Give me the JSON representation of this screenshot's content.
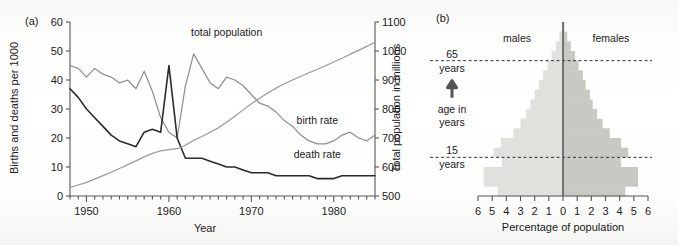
{
  "figure": {
    "panel_a_label": "(a)",
    "panel_b_label": "(b)"
  },
  "chart_data": [
    {
      "type": "line",
      "panel": "(a)",
      "title": "",
      "xlabel": "Year",
      "ylabel": "Births and deaths per 1000",
      "y2label": "Total population in millions",
      "xlim": [
        1948,
        1985
      ],
      "ylim": [
        0,
        60
      ],
      "y2lim": [
        500,
        1100
      ],
      "xticks": [
        1950,
        1960,
        1970,
        1980
      ],
      "xtick_labels": [
        "1950",
        "1960",
        "1970",
        "1980"
      ],
      "yticks": [
        0,
        10,
        20,
        30,
        40,
        50,
        60
      ],
      "ytick_labels": [
        "0",
        "10",
        "20",
        "30",
        "40",
        "50",
        "60"
      ],
      "y2ticks": [
        500,
        600,
        700,
        800,
        900,
        1000,
        1100
      ],
      "y2tick_labels": [
        "500",
        "600",
        "700",
        "800",
        "900",
        "1000",
        "1100"
      ],
      "minor_xtick_interval": 1,
      "grid": false,
      "legend_position": "inline-annotations",
      "series": [
        {
          "name": "birth rate",
          "label": "birth rate",
          "color": "#8f8f8f",
          "axis": "left",
          "units": "per 1000",
          "x": [
            1948,
            1949,
            1950,
            1951,
            1952,
            1953,
            1954,
            1955,
            1956,
            1957,
            1958,
            1959,
            1960,
            1961,
            1962,
            1963,
            1964,
            1965,
            1966,
            1967,
            1968,
            1969,
            1970,
            1971,
            1972,
            1973,
            1974,
            1975,
            1976,
            1977,
            1978,
            1979,
            1980,
            1981,
            1982,
            1983,
            1984,
            1985
          ],
          "values": [
            45,
            44,
            41,
            44,
            42,
            41,
            39,
            40,
            37,
            43,
            36,
            27,
            22,
            20,
            38,
            49,
            44,
            39,
            37,
            41,
            40,
            38,
            35,
            32,
            31,
            29,
            26,
            24,
            21,
            19,
            18,
            18,
            19,
            21,
            22,
            20,
            19,
            21
          ]
        },
        {
          "name": "death rate",
          "label": "death rate",
          "color": "#2a2a2a",
          "axis": "left",
          "units": "per 1000",
          "x": [
            1948,
            1949,
            1950,
            1951,
            1952,
            1953,
            1954,
            1955,
            1956,
            1957,
            1958,
            1959,
            1960,
            1961,
            1962,
            1963,
            1964,
            1965,
            1966,
            1967,
            1968,
            1969,
            1970,
            1971,
            1972,
            1973,
            1974,
            1975,
            1976,
            1977,
            1978,
            1979,
            1980,
            1981,
            1982,
            1983,
            1984,
            1985
          ],
          "values": [
            37,
            34,
            30,
            27,
            24,
            21,
            19,
            18,
            17,
            22,
            23,
            22,
            45,
            20,
            13,
            13,
            13,
            12,
            11,
            10,
            10,
            9,
            8,
            8,
            8,
            7,
            7,
            7,
            7,
            7,
            6,
            6,
            6,
            7,
            7,
            7,
            7,
            7
          ]
        },
        {
          "name": "total population",
          "label": "total population",
          "color": "#9a9a9a",
          "axis": "right",
          "units": "millions",
          "x": [
            1948,
            1949,
            1950,
            1951,
            1952,
            1953,
            1954,
            1955,
            1956,
            1957,
            1958,
            1959,
            1960,
            1961,
            1962,
            1963,
            1964,
            1965,
            1966,
            1967,
            1968,
            1969,
            1970,
            1971,
            1972,
            1973,
            1974,
            1975,
            1976,
            1977,
            1978,
            1979,
            1980,
            1981,
            1982,
            1983,
            1984,
            1985
          ],
          "values": [
            530,
            538,
            547,
            558,
            570,
            582,
            595,
            608,
            621,
            635,
            647,
            656,
            660,
            663,
            675,
            692,
            705,
            720,
            735,
            754,
            775,
            797,
            818,
            837,
            855,
            872,
            887,
            900,
            913,
            925,
            937,
            949,
            962,
            975,
            989,
            1002,
            1016,
            1030
          ]
        }
      ],
      "annotations": [
        {
          "text": "total population",
          "x": 1967,
          "y2": 1030
        },
        {
          "text": "birth rate",
          "x": 1978,
          "y": 25
        },
        {
          "text": "death rate",
          "x": 1978,
          "y": 13
        }
      ]
    },
    {
      "type": "bar",
      "orientation": "population-pyramid",
      "panel": "(b)",
      "title": "",
      "xlabel": "Percentage of population",
      "ylabel": "age in years",
      "xlim": [
        -6,
        6
      ],
      "xticks": [
        -6,
        -5,
        -4,
        -3,
        -2,
        -1,
        0,
        1,
        2,
        3,
        4,
        5,
        6
      ],
      "xtick_labels": [
        "6",
        "5",
        "4",
        "3",
        "2",
        "1",
        "0",
        "1",
        "2",
        "3",
        "4",
        "5",
        "6"
      ],
      "grid": false,
      "left_group_label": "males",
      "right_group_label": "females",
      "axis_arrow_label": "age in years",
      "reference_lines": [
        {
          "label_top": "65",
          "label_bottom": "years",
          "age": 65
        },
        {
          "label_top": "15",
          "label_bottom": "years",
          "age": 15
        }
      ],
      "male_color": "#e0e0dd",
      "female_color": "#c9c9c4",
      "age_groups": [
        "0-4",
        "5-9",
        "10-14",
        "15-19",
        "20-24",
        "25-29",
        "30-34",
        "35-39",
        "40-44",
        "45-49",
        "50-54",
        "55-59",
        "60-64",
        "65-69",
        "70-74",
        "75-79",
        "80-84",
        "85+"
      ],
      "series": [
        {
          "name": "males",
          "color": "#e0e0dd",
          "values": [
            4.6,
            5.6,
            5.6,
            4.3,
            4.9,
            4.4,
            3.5,
            3.0,
            2.6,
            2.3,
            2.0,
            1.7,
            1.4,
            1.1,
            0.8,
            0.5,
            0.25,
            0.08
          ]
        },
        {
          "name": "females",
          "color": "#c9c9c4",
          "values": [
            4.4,
            5.3,
            5.3,
            4.1,
            4.6,
            4.1,
            3.3,
            2.8,
            2.4,
            2.1,
            1.9,
            1.6,
            1.4,
            1.1,
            0.85,
            0.55,
            0.3,
            0.1
          ]
        }
      ]
    }
  ]
}
